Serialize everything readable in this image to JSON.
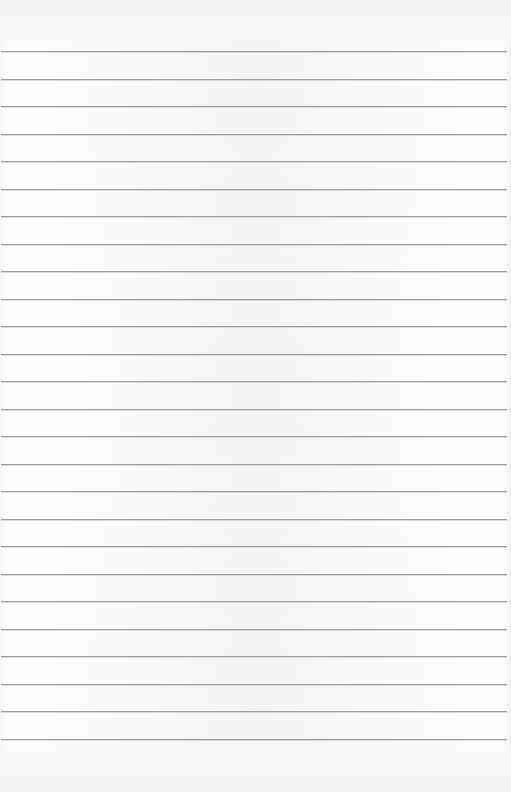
{
  "page": {
    "type": "lined-notebook-paper",
    "background_color": "#fcfcfc",
    "rule_color": "#9c9c9c",
    "rule_count": 26,
    "first_rule_y": 51,
    "rule_spacing": 27.52,
    "rule_left": 1,
    "rule_width": 506,
    "text": ""
  }
}
